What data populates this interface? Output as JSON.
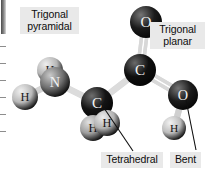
{
  "figure": {
    "background_color": "#ffffff",
    "label_background_color": "#e9e9e9",
    "label_text_color": "#0d0d0d",
    "leader_line_color": "#111111"
  },
  "labels": [
    {
      "id": "trigonal-pyramidal",
      "text": "Trigonal\npyramidal",
      "describes": "amine-nitrogen-group"
    },
    {
      "id": "trigonal-planar",
      "text": "Trigonal\nplanar",
      "describes": "carboxyl-carbon"
    },
    {
      "id": "tetrahedral",
      "text": "Tetrahedral",
      "describes": "alpha-carbon"
    },
    {
      "id": "bent",
      "text": "Bent",
      "describes": "hydroxyl-oxygen"
    }
  ],
  "atoms": [
    {
      "id": "h-amine-left",
      "element": "H",
      "cx": 25,
      "cy": 97,
      "r": 13,
      "color": "#b9b9b9",
      "highlight": "#f1f1f1",
      "text_color": "#1a1a1a"
    },
    {
      "id": "h-amine-top",
      "element": "H",
      "cx": 50,
      "cy": 70,
      "r": 13,
      "color": "#b5b5b5",
      "highlight": "#efefef",
      "text_color": "#1a1a1a"
    },
    {
      "id": "n-amine",
      "element": "N",
      "cx": 55,
      "cy": 82,
      "r": 15,
      "color": "#6f6f6f",
      "highlight": "#c9c9c9",
      "text_color": "#f2f2f2"
    },
    {
      "id": "c-alpha",
      "element": "C",
      "cx": 97,
      "cy": 103,
      "r": 16,
      "color": "#141414",
      "highlight": "#6e6e6e",
      "text_color": "#f5f5f5"
    },
    {
      "id": "h-alpha-left",
      "element": "H",
      "cx": 93,
      "cy": 128,
      "r": 13,
      "color": "#9e9e9e",
      "highlight": "#e2e2e2",
      "text_color": "#141414"
    },
    {
      "id": "h-alpha-right",
      "element": "H",
      "cx": 107,
      "cy": 123,
      "r": 13,
      "color": "#b2b2b2",
      "highlight": "#ededed",
      "text_color": "#141414"
    },
    {
      "id": "c-carboxyl",
      "element": "C",
      "cx": 140,
      "cy": 70,
      "r": 16,
      "color": "#0f0f0f",
      "highlight": "#6a6a6a",
      "text_color": "#f5f5f5"
    },
    {
      "id": "o-carbonyl",
      "element": "O",
      "cx": 146,
      "cy": 22,
      "r": 16,
      "color": "#1b1b1b",
      "highlight": "#757575",
      "text_color": "#f2f2f2"
    },
    {
      "id": "o-hydroxyl",
      "element": "O",
      "cx": 183,
      "cy": 95,
      "r": 15,
      "color": "#1b1b1b",
      "highlight": "#757575",
      "text_color": "#f2f2f2"
    },
    {
      "id": "h-hydroxyl",
      "element": "H",
      "cx": 174,
      "cy": 128,
      "r": 12,
      "color": "#bdbdbd",
      "highlight": "#f3f3f3",
      "text_color": "#141414"
    }
  ],
  "bonds": [
    {
      "id": "bond-n-h-left",
      "from": "n-amine",
      "to": "h-amine-left",
      "order": 1,
      "color": "#d4d4d4"
    },
    {
      "id": "bond-n-h-top",
      "from": "n-amine",
      "to": "h-amine-top",
      "order": 1,
      "color": "#d4d4d4"
    },
    {
      "id": "bond-n-c-alpha",
      "from": "n-amine",
      "to": "c-alpha",
      "order": 1,
      "color": "#dcdcdc"
    },
    {
      "id": "bond-c-alpha-h-left",
      "from": "c-alpha",
      "to": "h-alpha-left",
      "order": 1,
      "color": "#d0d0d0"
    },
    {
      "id": "bond-c-alpha-h-right",
      "from": "c-alpha",
      "to": "h-alpha-right",
      "order": 1,
      "color": "#d0d0d0"
    },
    {
      "id": "bond-c-alpha-c-carboxyl",
      "from": "c-alpha",
      "to": "c-carboxyl",
      "order": 1,
      "color": "#dcdcdc"
    },
    {
      "id": "bond-c-o-double",
      "from": "c-carboxyl",
      "to": "o-carbonyl",
      "order": 2,
      "color": "#d8d8d8"
    },
    {
      "id": "bond-c-o-hydroxyl",
      "from": "c-carboxyl",
      "to": "o-hydroxyl",
      "order": 2,
      "color": "#d8d8d8"
    },
    {
      "id": "bond-o-h",
      "from": "o-hydroxyl",
      "to": "h-hydroxyl",
      "order": 1,
      "color": "#cfcfcf"
    }
  ],
  "leaders": [
    {
      "id": "leader-tetrahedral",
      "x1": 104,
      "y1": 108,
      "x2": 133,
      "y2": 151
    },
    {
      "id": "leader-bent",
      "x1": 186,
      "y1": 100,
      "x2": 196,
      "y2": 150
    }
  ],
  "edge_marks": {
    "bar_color": "#4b4b4b",
    "tick_color": "#8d8d8d",
    "tick_positions": [
      46,
      63,
      80,
      97,
      114,
      131
    ]
  }
}
